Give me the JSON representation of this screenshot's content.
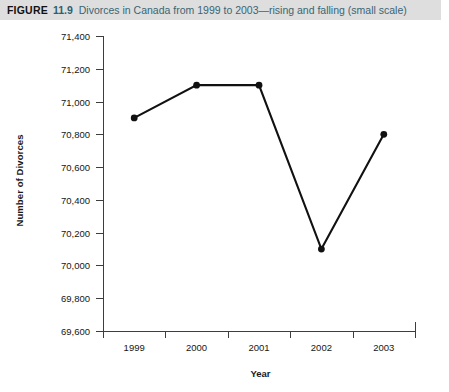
{
  "caption": {
    "figure_label": "FIGURE",
    "figure_number": "11.9",
    "figure_text": "Divorces in Canada from 1999 to 2003—rising and falling (small scale)",
    "band_color": "#dedede",
    "number_color": "#2e5f6e",
    "text_color": "#3a6573"
  },
  "chart_data": {
    "type": "line",
    "title": "Divorces in Canada from 1999 to 2003—rising and falling (small scale)",
    "xlabel": "Year",
    "ylabel": "Number of Divorces",
    "categories": [
      "1999",
      "2000",
      "2001",
      "2002",
      "2003"
    ],
    "values": [
      70900,
      71100,
      71100,
      70100,
      70800
    ],
    "value_labels": [
      "70,900",
      "71,100",
      "71,100",
      "70,100",
      "70,800"
    ],
    "ylim": [
      69600,
      71400
    ],
    "ytick_values": [
      71400,
      71200,
      71000,
      70800,
      70600,
      70400,
      70200,
      70000,
      69800,
      69600
    ],
    "ytick_labels": [
      "71,400",
      "71,200",
      "71,000",
      "70,800",
      "70,600",
      "70,400",
      "70,200",
      "70,000",
      "69,800",
      "69,600"
    ],
    "xtick_labels": [
      "1999",
      "2000",
      "2001",
      "2002",
      "2003"
    ],
    "grid": false,
    "legend": null,
    "series_color": "#111111",
    "marker": "circle",
    "axis_color": "#3d3d3d"
  }
}
